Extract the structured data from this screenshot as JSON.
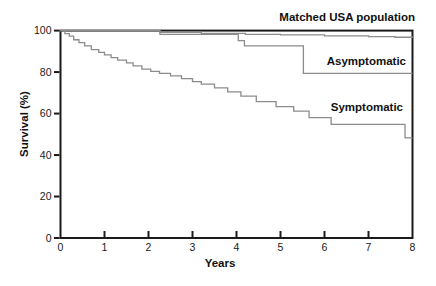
{
  "figure": {
    "xlabel": "Years",
    "ylabel": "Survival (%)",
    "series_labels": {
      "matched": "Matched USA population",
      "asymptomatic": "Asymptomatic",
      "symptomatic": "Symptomatic"
    }
  },
  "chart_data": {
    "type": "line",
    "subtype": "kaplan-meier-step",
    "title": "",
    "xlabel": "Years",
    "ylabel": "Survival (%)",
    "xlim": [
      0,
      8
    ],
    "ylim": [
      0,
      100
    ],
    "x_ticks": [
      0,
      1,
      2,
      3,
      4,
      5,
      6,
      7,
      8
    ],
    "y_ticks": [
      0,
      20,
      40,
      60,
      80,
      100
    ],
    "grid": false,
    "legend_position": "inline-labels",
    "axis_color": "#1a1a1a",
    "series_color": "#8c8c8c",
    "text_color": "#1a1a1a",
    "series": [
      {
        "name": "Matched USA population",
        "points": [
          [
            0,
            100
          ],
          [
            2.26,
            99.2
          ],
          [
            3.2,
            98.7
          ],
          [
            4.2,
            98.2
          ],
          [
            5.0,
            97.9
          ],
          [
            6.0,
            97.5
          ],
          [
            7.0,
            97.1
          ],
          [
            7.6,
            96.8
          ],
          [
            8,
            96.6
          ]
        ]
      },
      {
        "name": "Asymptomatic",
        "points": [
          [
            0,
            100
          ],
          [
            2.26,
            98.2
          ],
          [
            4.04,
            95.2
          ],
          [
            4.18,
            92.6
          ],
          [
            5.52,
            79.4
          ],
          [
            8,
            79.4
          ]
        ]
      },
      {
        "name": "Symptomatic",
        "points": [
          [
            0,
            100
          ],
          [
            0.1,
            98.5
          ],
          [
            0.2,
            97.3
          ],
          [
            0.3,
            95.6
          ],
          [
            0.42,
            94.2
          ],
          [
            0.55,
            92.6
          ],
          [
            0.7,
            90.8
          ],
          [
            0.87,
            89.5
          ],
          [
            1.0,
            88.3
          ],
          [
            1.15,
            87.0
          ],
          [
            1.3,
            85.8
          ],
          [
            1.5,
            84.4
          ],
          [
            1.65,
            83.0
          ],
          [
            1.85,
            81.4
          ],
          [
            2.05,
            80.3
          ],
          [
            2.25,
            79.4
          ],
          [
            2.5,
            78.2
          ],
          [
            2.75,
            76.8
          ],
          [
            3.0,
            75.4
          ],
          [
            3.2,
            74.2
          ],
          [
            3.5,
            72.4
          ],
          [
            3.8,
            70.5
          ],
          [
            4.1,
            68.4
          ],
          [
            4.45,
            65.8
          ],
          [
            4.9,
            63.3
          ],
          [
            5.3,
            61.2
          ],
          [
            5.65,
            58.0
          ],
          [
            6.15,
            54.8
          ],
          [
            7.83,
            48.3
          ],
          [
            8,
            48.3
          ]
        ]
      }
    ]
  }
}
